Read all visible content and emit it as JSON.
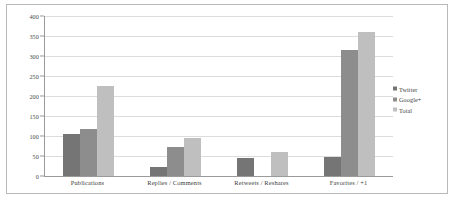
{
  "chart_data": {
    "type": "bar",
    "title": "",
    "subtitle": "",
    "xlabel": "",
    "ylabel": "",
    "ylim": [
      0,
      400
    ],
    "ytick_labels": [
      "400",
      "350",
      "300",
      "250",
      "200",
      "150",
      "100",
      "50",
      "0"
    ],
    "yticks": [
      400,
      350,
      300,
      250,
      200,
      150,
      100,
      50,
      0
    ],
    "grid": "horizontal",
    "legend_position": "right",
    "categories": [
      "Publications",
      "Replies / Comments",
      "Retweets / Reshares",
      "Favorites / +1"
    ],
    "series": [
      {
        "name": "Twitter",
        "color": "#757575",
        "values": [
          105,
          22,
          45,
          48
        ]
      },
      {
        "name": "Google+",
        "color": "#8d8d8d",
        "values": [
          118,
          72,
          0,
          315
        ]
      },
      {
        "name": "Total",
        "color": "#bfbfbf",
        "values": [
          225,
          95,
          60,
          360
        ]
      }
    ]
  },
  "legend": {
    "items": [
      {
        "label": "Twitter"
      },
      {
        "label": "Google+"
      },
      {
        "label": "Total"
      }
    ]
  }
}
